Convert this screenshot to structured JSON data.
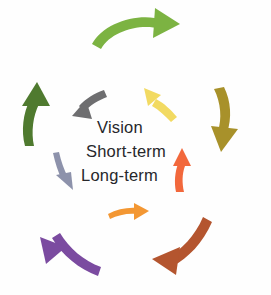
{
  "diagram": {
    "background_color": "#fefefe",
    "center_labels": [
      {
        "text": "Vision",
        "color": "#27272b"
      },
      {
        "text": "Short-term",
        "color": "#27272b"
      },
      {
        "text": "Long-term",
        "color": "#27272b"
      }
    ],
    "outer_arrows": [
      {
        "name": "green-arrow-top",
        "color": "#7cb342",
        "direction": "clockwise",
        "position": "top"
      },
      {
        "name": "olive-arrow-right",
        "color": "#a8912a",
        "direction": "clockwise",
        "position": "right"
      },
      {
        "name": "brown-arrow-bottom-right",
        "color": "#b4552f",
        "direction": "clockwise",
        "position": "bottom-right"
      },
      {
        "name": "purple-arrow-bottom-left",
        "color": "#7b4ba0",
        "direction": "clockwise",
        "position": "bottom-left"
      },
      {
        "name": "darkgreen-arrow-left",
        "color": "#4f7a2f",
        "direction": "clockwise",
        "position": "left"
      }
    ],
    "inner_arrows": [
      {
        "name": "gray-arrow-top-left",
        "color": "#6e6e70",
        "direction": "counter-clockwise",
        "position": "top-left"
      },
      {
        "name": "yellow-arrow-top-right",
        "color": "#f2da62",
        "direction": "counter-clockwise",
        "position": "top-right"
      },
      {
        "name": "orangered-arrow-right",
        "color": "#f2683c",
        "direction": "counter-clockwise",
        "position": "right"
      },
      {
        "name": "orange-arrow-bottom",
        "color": "#f39733",
        "direction": "clockwise",
        "position": "bottom"
      },
      {
        "name": "slate-arrow-left",
        "color": "#8d92ab",
        "direction": "clockwise",
        "position": "left"
      }
    ]
  }
}
